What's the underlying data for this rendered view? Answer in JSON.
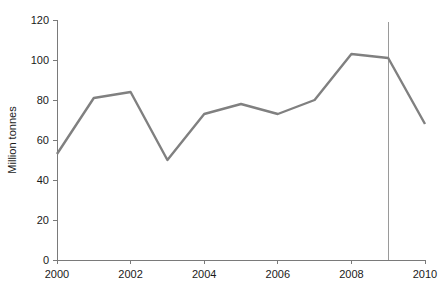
{
  "chart_data": {
    "type": "line",
    "title": "",
    "xlabel": "",
    "ylabel": "Million tonnes",
    "x": [
      2000,
      2001,
      2002,
      2003,
      2004,
      2005,
      2006,
      2007,
      2008,
      2009,
      2010
    ],
    "values": [
      53,
      81,
      84,
      50,
      73,
      78,
      73,
      80,
      103,
      101,
      68
    ],
    "series": [
      {
        "name": "Million tonnes",
        "values": [
          53,
          81,
          84,
          50,
          73,
          78,
          73,
          80,
          103,
          101,
          68
        ]
      }
    ],
    "xlim": [
      2000,
      2010
    ],
    "ylim": [
      0,
      120
    ],
    "yticks": [
      0,
      20,
      40,
      60,
      80,
      100,
      120
    ],
    "ytick_labels": [
      "0",
      "20",
      "40",
      "60",
      "80",
      "100",
      "120"
    ],
    "xticks": [
      2000,
      2002,
      2004,
      2006,
      2008,
      2010
    ],
    "xtick_labels": [
      "2000",
      "2002",
      "2004",
      "2006",
      "2008",
      "2010"
    ],
    "grid": false,
    "legend": "none",
    "annotations": [
      {
        "name": "forecast-divider",
        "type": "vline",
        "x": 2009,
        "label": ""
      }
    ],
    "colors": {
      "line": "#808080",
      "axis": "#7a7a7a",
      "text": "#1a1a1a",
      "divider": "#9a9a9a",
      "background": "#ffffff"
    }
  }
}
